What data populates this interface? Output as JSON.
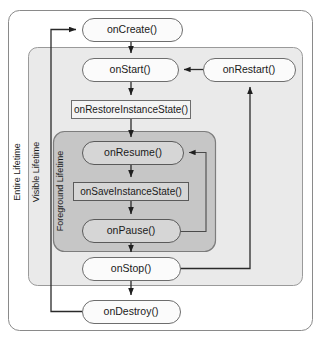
{
  "diagram": {
    "lanes": [
      {
        "id": "entire",
        "label": "Entire Lifetime",
        "fill": "#ffffff"
      },
      {
        "id": "visible",
        "label": "Visible Lifetime",
        "fill": "#eaeaea"
      },
      {
        "id": "foreground",
        "label": "Foreground Lifetime",
        "fill": "#c6c6c6"
      }
    ],
    "nodes": [
      {
        "id": "onCreate",
        "label": "onCreate()",
        "shape": "rounded",
        "shaded": false
      },
      {
        "id": "onStart",
        "label": "onStart()",
        "shape": "rounded",
        "shaded": false
      },
      {
        "id": "onRestart",
        "label": "onRestart()",
        "shape": "rounded",
        "shaded": false
      },
      {
        "id": "onRestoreInstanceState",
        "label": "onRestoreInstanceState()",
        "shape": "rect",
        "shaded": false
      },
      {
        "id": "onResume",
        "label": "onResume()",
        "shape": "rounded",
        "shaded": true
      },
      {
        "id": "onSaveInstanceState",
        "label": "onSaveInstanceState()",
        "shape": "rect",
        "shaded": true
      },
      {
        "id": "onPause",
        "label": "onPause()",
        "shape": "rounded",
        "shaded": true
      },
      {
        "id": "onStop",
        "label": "onStop()",
        "shape": "rounded",
        "shaded": false
      },
      {
        "id": "onDestroy",
        "label": "onDestroy()",
        "shape": "rounded",
        "shaded": false
      }
    ],
    "edges": [
      {
        "from": "onDestroy",
        "to": "onCreate",
        "kind": "loop-left"
      },
      {
        "from": "onCreate",
        "to": "onStart",
        "kind": "down"
      },
      {
        "from": "onRestart",
        "to": "onStart",
        "kind": "left"
      },
      {
        "from": "onStart",
        "to": "onRestoreInstanceState",
        "kind": "down"
      },
      {
        "from": "onRestoreInstanceState",
        "to": "onResume",
        "kind": "down"
      },
      {
        "from": "onResume",
        "to": "onSaveInstanceState",
        "kind": "down"
      },
      {
        "from": "onSaveInstanceState",
        "to": "onPause",
        "kind": "down"
      },
      {
        "from": "onPause",
        "to": "onResume",
        "kind": "loop-right"
      },
      {
        "from": "onPause",
        "to": "onStop",
        "kind": "down"
      },
      {
        "from": "onStop",
        "to": "onRestart",
        "kind": "loop-right-up"
      },
      {
        "from": "onStop",
        "to": "onDestroy",
        "kind": "down"
      }
    ]
  }
}
